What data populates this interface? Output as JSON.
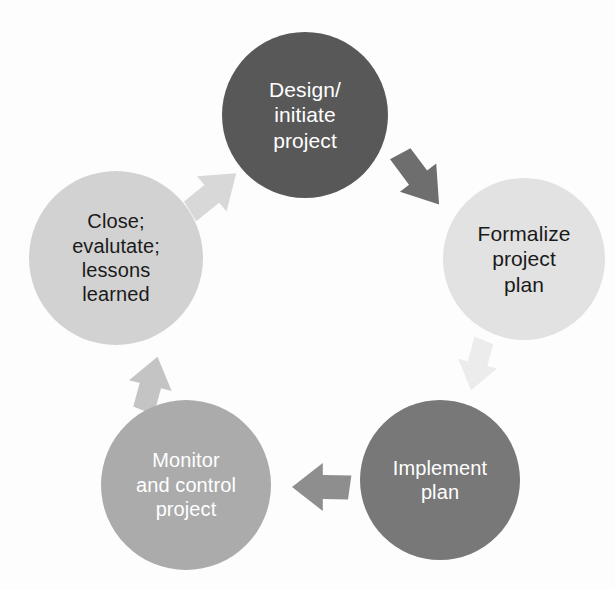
{
  "diagram": {
    "type": "cycle-diagram",
    "background_color": "#fdfdfd",
    "direction": "clockwise",
    "nodes": [
      {
        "id": "design-initiate-project",
        "label": "Design/\ninitiate\nproject",
        "label_lines": [
          "Design/",
          "initiate",
          "project"
        ],
        "order": 1,
        "fill_color": "#585858",
        "text_color": "#ffffff",
        "font_size": 21,
        "cx": 305,
        "cy": 115,
        "r": 83
      },
      {
        "id": "formalize-project-plan",
        "label": "Formalize\nproject\nplan",
        "label_lines": [
          "Formalize",
          "project",
          "plan"
        ],
        "order": 2,
        "fill_color": "#e2e2e2",
        "text_color": "#1a1a1a",
        "font_size": 21,
        "cx": 524,
        "cy": 259,
        "r": 81
      },
      {
        "id": "implement-plan",
        "label": "Implement\nplan",
        "label_lines": [
          "Implement",
          "plan"
        ],
        "order": 3,
        "fill_color": "#787878",
        "text_color": "#ffffff",
        "font_size": 20,
        "cx": 440,
        "cy": 480,
        "r": 80
      },
      {
        "id": "monitor-and-control-project",
        "label": "Monitor\nand control\nproject",
        "label_lines": [
          "Monitor",
          "and control",
          "project"
        ],
        "order": 4,
        "fill_color": "#ababab",
        "text_color": "#ffffff",
        "font_size": 20,
        "cx": 186,
        "cy": 485,
        "r": 85
      },
      {
        "id": "close-evaluate-lessons-learned",
        "label": "Close;\nevalutate;\nlessons\nlearned",
        "label_lines": [
          "Close;",
          "evalutate;",
          "lessons",
          "learned"
        ],
        "order": 5,
        "fill_color": "#d2d2d2",
        "text_color": "#1a1a1a",
        "font_size": 20,
        "cx": 116,
        "cy": 258,
        "r": 87
      }
    ],
    "arrows": [
      {
        "id": "arrow-design-to-formalize",
        "from": "design-initiate-project",
        "to": "formalize-project-plan",
        "fill_color": "#6e6e6e",
        "cx": 420,
        "cy": 180,
        "rotation": 52,
        "length": 62,
        "width": 46
      },
      {
        "id": "arrow-formalize-to-implement",
        "from": "formalize-project-plan",
        "to": "implement-plan",
        "fill_color": "#ececec",
        "cx": 477,
        "cy": 366,
        "rotation": 104,
        "length": 50,
        "width": 40
      },
      {
        "id": "arrow-implement-to-monitor",
        "from": "implement-plan",
        "to": "monitor-and-control-project",
        "fill_color": "#8e8e8e",
        "cx": 320,
        "cy": 487,
        "rotation": 180,
        "length": 56,
        "width": 48
      },
      {
        "id": "arrow-monitor-to-close",
        "from": "monitor-and-control-project",
        "to": "close-evaluate-lessons-learned",
        "fill_color": "#c4c4c4",
        "cx": 151,
        "cy": 383,
        "rotation": -76,
        "length": 54,
        "width": 44
      },
      {
        "id": "arrow-close-to-design",
        "from": "close-evaluate-lessons-learned",
        "to": "design-initiate-project",
        "fill_color": "#d8d8d8",
        "cx": 214,
        "cy": 192,
        "rotation": -40,
        "length": 58,
        "width": 46
      }
    ]
  }
}
